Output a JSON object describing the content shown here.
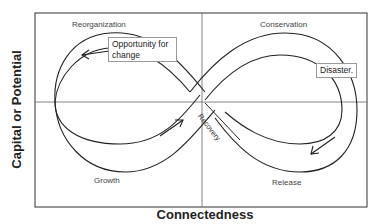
{
  "figure": {
    "y_axis_label": "Capital or Potential",
    "x_axis_label": "Connectedness",
    "phases": {
      "top_left": "Reorganization",
      "top_right": "Conservation",
      "bottom_left": "Growth",
      "bottom_right": "Release"
    },
    "callouts": {
      "opportunity": "Opportunity for change",
      "opportunity_line1": "Opportunity for",
      "opportunity_line2": "change",
      "disaster": "Disaster.",
      "recovery": "Recovery."
    },
    "arrows": [
      {
        "name": "growth-arrow",
        "direction": "up-right"
      },
      {
        "name": "release-arrow",
        "direction": "down-left"
      },
      {
        "name": "reorganization-arrow",
        "direction": "left"
      }
    ],
    "colors": {
      "line": "#222222",
      "frame": "#333333",
      "axis": "#555555",
      "callout_border": "#999999",
      "background": "#ffffff"
    }
  }
}
